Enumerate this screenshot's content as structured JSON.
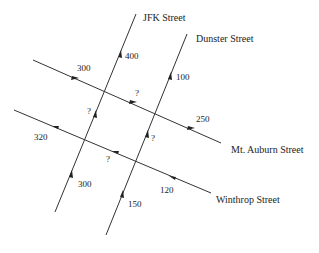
{
  "diagram": {
    "title": "",
    "streets": [
      {
        "id": "jfk",
        "label": "JFK Street",
        "from": [
          55,
          212
        ],
        "to": [
          136,
          14
        ]
      },
      {
        "id": "dunster",
        "label": "Dunster Street",
        "from": [
          106,
          235
        ],
        "to": [
          187,
          34
        ]
      },
      {
        "id": "mt_auburn",
        "label": "Mt. Auburn Street",
        "from": [
          33,
          60
        ],
        "to": [
          221,
          143
        ]
      },
      {
        "id": "winthrop",
        "label": "Winthrop Street",
        "from": [
          14,
          110
        ],
        "to": [
          211,
          193
        ]
      }
    ],
    "flows": {
      "jfk_top": "400",
      "jfk_mid": "?",
      "jfk_bottom": "300",
      "dunster_top": "100",
      "dunster_mid": "?",
      "dunster_bottom": "150",
      "mt_auburn_left": "300",
      "mt_auburn_mid": "?",
      "mt_auburn_right": "250",
      "winthrop_left": "320",
      "winthrop_mid": "?",
      "winthrop_right": "120"
    },
    "colors": {
      "line": "#333333",
      "text": "#222222",
      "background": "#ffffff"
    }
  }
}
